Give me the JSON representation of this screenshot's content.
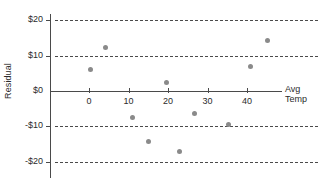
{
  "chart_data": {
    "type": "scatter",
    "title": "",
    "xlabel": "Avg Temp",
    "ylabel": "Residual",
    "xlabel_lines": [
      "Avg",
      "Temp"
    ],
    "xticks": [
      0,
      10,
      20,
      30,
      40
    ],
    "xtick_labels": [
      "0",
      "10",
      "20",
      "30",
      "40"
    ],
    "yticks": [
      20,
      10,
      0,
      -10,
      -20
    ],
    "ytick_labels": [
      "$20",
      "$10",
      "$0",
      "-$10",
      "-$20"
    ],
    "xlim": [
      -10,
      52
    ],
    "ylim": [
      -22,
      22
    ],
    "grid": true,
    "grid_style": "dashed-horizontal",
    "legend": "none",
    "point_color": "#8a8a8a",
    "axis_color": "#4a4a4a",
    "x": [
      0.5,
      4.3,
      10.9,
      15.0,
      19.7,
      23.0,
      26.6,
      35.4,
      40.8,
      45.3
    ],
    "y": [
      6.0,
      12.2,
      -7.4,
      -14.4,
      2.3,
      -17.0,
      -6.5,
      -9.6,
      6.8,
      14.4
    ],
    "points": [
      {
        "x": 0.5,
        "y": 6.0
      },
      {
        "x": 4.3,
        "y": 12.2
      },
      {
        "x": 10.9,
        "y": -7.4
      },
      {
        "x": 15.0,
        "y": -14.4
      },
      {
        "x": 19.7,
        "y": 2.3
      },
      {
        "x": 23.0,
        "y": -17.0
      },
      {
        "x": 26.6,
        "y": -6.5
      },
      {
        "x": 35.4,
        "y": -9.6
      },
      {
        "x": 40.8,
        "y": 6.8
      },
      {
        "x": 45.3,
        "y": 14.4
      }
    ]
  },
  "axes": {
    "y_title": "Residual",
    "x_title_line1": "Avg",
    "x_title_line2": "Temp",
    "y_labels": [
      "$20",
      "$10",
      "$0",
      "-$10",
      "-$20"
    ],
    "x_labels": [
      "0",
      "10",
      "20",
      "30",
      "40"
    ]
  }
}
